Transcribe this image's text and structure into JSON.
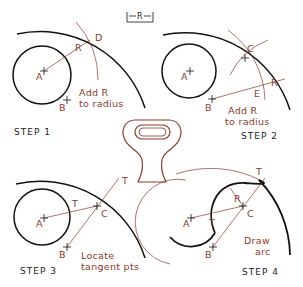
{
  "diagram": {
    "dimension_key": {
      "label": "R"
    },
    "colors": {
      "line": "#111111",
      "construction": "#8a3a2a",
      "part": "#8a3a2a"
    },
    "steps": [
      {
        "id": 1,
        "label": "STEP 1",
        "note_line1": "Add R",
        "note_line2": "to radius",
        "points": [
          "A",
          "B",
          "D"
        ],
        "dim": "R"
      },
      {
        "id": 2,
        "label": "STEP 2",
        "note_line1": "Add R",
        "note_line2": "to radius",
        "points": [
          "A",
          "B",
          "C",
          "E"
        ],
        "dim": "R"
      },
      {
        "id": 3,
        "label": "STEP 3",
        "note_line1": "Locate",
        "note_line2": "tangent pts",
        "points": [
          "A",
          "B",
          "C",
          "T",
          "T"
        ]
      },
      {
        "id": 4,
        "label": "STEP 4",
        "note_line1": "Draw",
        "note_line2": "arc",
        "points": [
          "A",
          "B",
          "C",
          "T",
          "T"
        ],
        "dim": "R"
      }
    ],
    "center_part": "cam-shaped wrench/link section (hatched)"
  }
}
